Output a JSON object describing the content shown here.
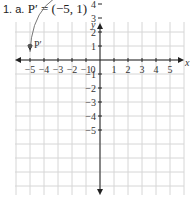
{
  "problem": {
    "number": "1. a.",
    "statement": "P′ = (−5, 1)"
  },
  "chart_data": {
    "type": "scatter",
    "title": "P′ = (−5, 1)",
    "xlabel": "x",
    "ylabel": "y",
    "xlim": [
      -5,
      5
    ],
    "ylim": [
      -5,
      5
    ],
    "grid": true,
    "x_ticks": [
      "-5",
      "-4",
      "-3",
      "-2",
      "-1",
      "0",
      "1",
      "2",
      "3",
      "4",
      "5"
    ],
    "y_ticks": [
      "-5",
      "-4",
      "-3",
      "-2",
      "-1",
      "1",
      "2",
      "3",
      "4",
      "5"
    ],
    "points": [
      {
        "label": "P",
        "x": 1,
        "y": 5
      },
      {
        "label": "P′",
        "x": -5,
        "y": 1
      }
    ],
    "annotations": [
      "curved arrow from P to P′ (rotation 90° counterclockwise)"
    ]
  },
  "colors": {
    "grid": "#d6d6d6",
    "axis": "#222222",
    "point": "#555555",
    "arc": "#777777"
  }
}
